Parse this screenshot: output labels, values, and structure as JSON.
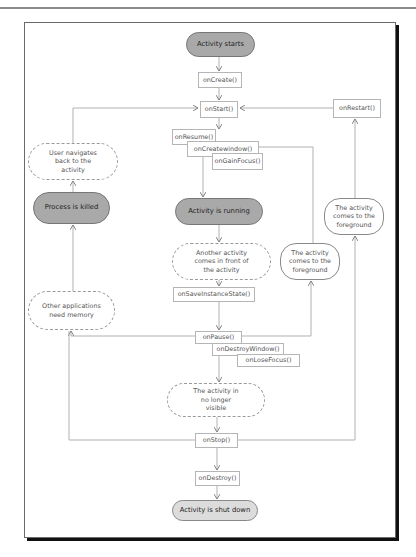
{
  "diagram": {
    "colors": {
      "state_fill_dark": "#a9a9a9",
      "state_fill_light": "#dcdcdc",
      "line": "#a0a0a0",
      "frame_shadow": "#111111"
    },
    "nodes": {
      "activity_starts": "Activity starts",
      "on_create": "onCreate()",
      "on_start": "onStart()",
      "on_restart": "onRestart()",
      "on_resume": "onResume()",
      "on_create_window": "onCreatewindow()",
      "on_gain_focus": "onGainFocus()",
      "user_navigates_back": "User navigates back to the activity",
      "process_killed": "Process is killed",
      "activity_running": "Activity is running",
      "comes_to_foreground_1": "The activity comes to the foreground",
      "comes_to_foreground_2": "The activity comes to the foreground",
      "another_activity_front": "Another activity comes in front of the activity",
      "on_save_instance_state": "onSaveInstanceState()",
      "other_apps_need_memory": "Other applications need memory",
      "on_pause": "onPause()",
      "on_destroy_window": "onDestroyWindow()",
      "on_lose_focus": "onLoseFocus()",
      "no_longer_visible": "The activity in no longer visible",
      "on_stop": "onStop()",
      "on_destroy": "onDestroy()",
      "activity_shut_down": "Activity is shut down"
    },
    "edges": [
      [
        "Activity starts",
        "onCreate()"
      ],
      [
        "onCreate()",
        "onStart()"
      ],
      [
        "onStart()",
        "onResume()"
      ],
      [
        "onResume()",
        "Activity is running"
      ],
      [
        "Activity is running",
        "Another activity comes in front of the activity"
      ],
      [
        "Another activity comes in front of the activity",
        "onSaveInstanceState()"
      ],
      [
        "onSaveInstanceState()",
        "onPause()"
      ],
      [
        "onPause()",
        "The activity in no longer visible"
      ],
      [
        "The activity in no longer visible",
        "onStop()"
      ],
      [
        "onStop()",
        "onDestroy()"
      ],
      [
        "onDestroy()",
        "Activity is shut down"
      ],
      [
        "onPause()",
        "Other applications need memory"
      ],
      [
        "onStop()",
        "Other applications need memory"
      ],
      [
        "Other applications need memory",
        "Process is killed"
      ],
      [
        "Process is killed",
        "User navigates back to the activity"
      ],
      [
        "User navigates back to the activity",
        "onStart()"
      ],
      [
        "onPause()",
        "The activity comes to the foreground (1)"
      ],
      [
        "The activity comes to the foreground (1)",
        "onCreatewindow()"
      ],
      [
        "onStop()",
        "The activity comes to the foreground (2)"
      ],
      [
        "The activity comes to the foreground (2)",
        "onRestart()"
      ],
      [
        "onRestart()",
        "onStart()"
      ]
    ]
  }
}
